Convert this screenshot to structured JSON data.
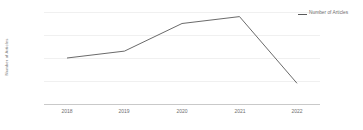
{
  "chart_data": {
    "type": "line",
    "title": "",
    "xlabel": "",
    "ylabel": "Number of Articles",
    "categories": [
      "2018",
      "2019",
      "2020",
      "2021",
      "2022"
    ],
    "x": [
      2018,
      2019,
      2020,
      2021,
      2022
    ],
    "series": [
      {
        "name": "Number of Articles",
        "values": [
          20,
          23,
          35,
          38,
          9
        ],
        "color": "#595959"
      }
    ],
    "ylim": [
      0,
      40
    ],
    "yticks": [
      0,
      10,
      20,
      30,
      40
    ],
    "ytick_labels": [
      "0",
      "10",
      "20",
      "30",
      "40"
    ],
    "grid": true,
    "grid_color": "#f0f0f0",
    "axis_color": "#c9c9c9",
    "legend": {
      "position": "right",
      "entries": [
        {
          "label": "Number of Articles",
          "marker": "line",
          "color": "#595959"
        }
      ]
    }
  },
  "axis": {
    "y_title": "Number of Articles",
    "tick_0": "0",
    "tick_1": "10",
    "tick_2": "20",
    "tick_3": "30",
    "tick_4": "40",
    "x_0": "2018",
    "x_1": "2019",
    "x_2": "2020",
    "x_3": "2021",
    "x_4": "2022"
  },
  "legend": {
    "entry_label": "Number of Articles"
  }
}
